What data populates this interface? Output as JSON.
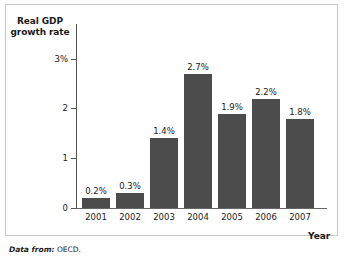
{
  "chart_data": {
    "type": "bar",
    "title": "",
    "categories": [
      "2001",
      "2002",
      "2003",
      "2004",
      "2005",
      "2006",
      "2007"
    ],
    "values": [
      0.2,
      0.3,
      1.4,
      2.7,
      1.9,
      2.2,
      1.8
    ],
    "data_labels": [
      "0.2%",
      "0.3%",
      "1.4%",
      "2.7%",
      "1.9%",
      "2.2%",
      "1.8%"
    ],
    "xlabel": "Year",
    "ylabel": "Real GDP\ngrowth rate",
    "ylim": [
      0,
      3.35
    ],
    "yticks": [
      0,
      1,
      2,
      3
    ],
    "ytick_labels": [
      "0",
      "1",
      "2",
      "3%"
    ],
    "grid": false,
    "legend": "none",
    "series_color": "#4c4c4c"
  },
  "footer": {
    "source_lead": "Data from:",
    "source_value": "OECD."
  }
}
